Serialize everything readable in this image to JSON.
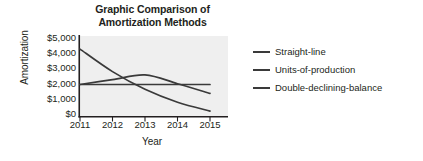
{
  "chart_data": {
    "type": "line",
    "title": "Graphic Comparison of Amortization Methods",
    "title_lines": [
      "Graphic Comparison of",
      "Amortization Methods"
    ],
    "xlabel": "Year",
    "ylabel": "Amortization",
    "categories": [
      "2011",
      "2012",
      "2013",
      "2014",
      "2015"
    ],
    "x": [
      2011,
      2012,
      2013,
      2014,
      2015
    ],
    "xlim": [
      2011,
      2015
    ],
    "ylim": [
      0,
      5000
    ],
    "yticks": [
      0,
      1000,
      2000,
      3000,
      4000,
      5000
    ],
    "ytick_labels": [
      "$0",
      "$1,000",
      "$2,000",
      "$3,000",
      "$4,000",
      "$5,000"
    ],
    "xtick_labels": [
      "2011",
      "2012",
      "2013",
      "2014",
      "2015"
    ],
    "grid": false,
    "legend_position": "right",
    "plot_background": "#efefef",
    "line_color": "#3a3a3a",
    "series": [
      {
        "name": "Straight-line",
        "values": [
          2000,
          2000,
          2000,
          2000,
          2000
        ],
        "color": "#3a3a3a"
      },
      {
        "name": "Units-of-production",
        "values": [
          2000,
          2300,
          2600,
          2050,
          1450
        ],
        "color": "#3a3a3a"
      },
      {
        "name": "Double-declining-balance",
        "values": [
          4200,
          2800,
          1700,
          900,
          350
        ],
        "color": "#3a3a3a"
      }
    ]
  },
  "legend": {
    "items": [
      {
        "label": "Straight-line"
      },
      {
        "label": "Units-of-production"
      },
      {
        "label": "Double-declining-balance"
      }
    ]
  }
}
